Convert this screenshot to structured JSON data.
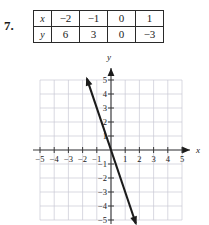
{
  "problem": {
    "number": "7."
  },
  "table": {
    "rows": [
      {
        "header": "x",
        "cells": [
          "−2",
          "−1",
          "0",
          "1"
        ]
      },
      {
        "header": "y",
        "cells": [
          "6",
          "3",
          "0",
          "−3"
        ]
      }
    ]
  },
  "graph": {
    "x_axis_label": "x",
    "y_axis_label": "y",
    "x_tick_labels": [
      "−5",
      "−4",
      "−3",
      "−2",
      "−1",
      "1",
      "2",
      "3",
      "4",
      "5"
    ],
    "y_tick_labels": [
      "5",
      "4",
      "3",
      "2",
      "1",
      "−1",
      "−2",
      "−3",
      "−4",
      "−5"
    ],
    "colors": {
      "grid": "#c9c9d4",
      "axis": "#3a3a3a",
      "line": "#1b1b1b"
    }
  },
  "chart_data": {
    "type": "line",
    "title": "",
    "xlabel": "x",
    "ylabel": "y",
    "xlim": [
      -5,
      5
    ],
    "ylim": [
      -5,
      5
    ],
    "grid": true,
    "legend": "none",
    "xticks": [
      -5,
      -4,
      -3,
      -2,
      -1,
      1,
      2,
      3,
      4,
      5
    ],
    "yticks": [
      5,
      4,
      3,
      2,
      1,
      -1,
      -2,
      -3,
      -4,
      -5
    ],
    "series": [
      {
        "name": "y = -3x",
        "equation": "y = -3x",
        "slope": -3,
        "intercept": 0,
        "x": [
          -2,
          -1,
          0,
          1
        ],
        "values": [
          6,
          3,
          0,
          -3
        ],
        "drawn_segment": {
          "x_start": -1.7,
          "y_start": 5.1,
          "x_end": 1.75,
          "y_end": -5.25
        },
        "arrows": [
          "start",
          "end"
        ]
      }
    ]
  }
}
